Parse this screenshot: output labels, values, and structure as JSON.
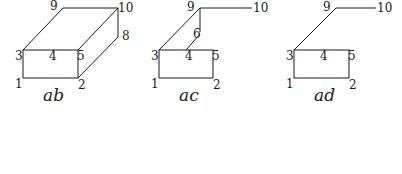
{
  "figures": [
    {
      "caption": "ab",
      "labels": {
        "v1": "1",
        "v2": "2",
        "v3": "3",
        "v4": "4",
        "v5": "5",
        "v8": "8",
        "v9": "9",
        "v10": "10"
      }
    },
    {
      "caption": "ac",
      "labels": {
        "v1": "1",
        "v2": "2",
        "v3": "3",
        "v4": "4",
        "v5": "5",
        "v6": "6",
        "v9": "9",
        "v10": "10"
      }
    },
    {
      "caption": "ad",
      "labels": {
        "v1": "1",
        "v2": "2",
        "v3": "3",
        "v4": "4",
        "v5": "5",
        "v9": "9",
        "v10": "10"
      }
    }
  ],
  "colors": {
    "stroke": "#1a1a1a",
    "background": "#ffffff"
  }
}
